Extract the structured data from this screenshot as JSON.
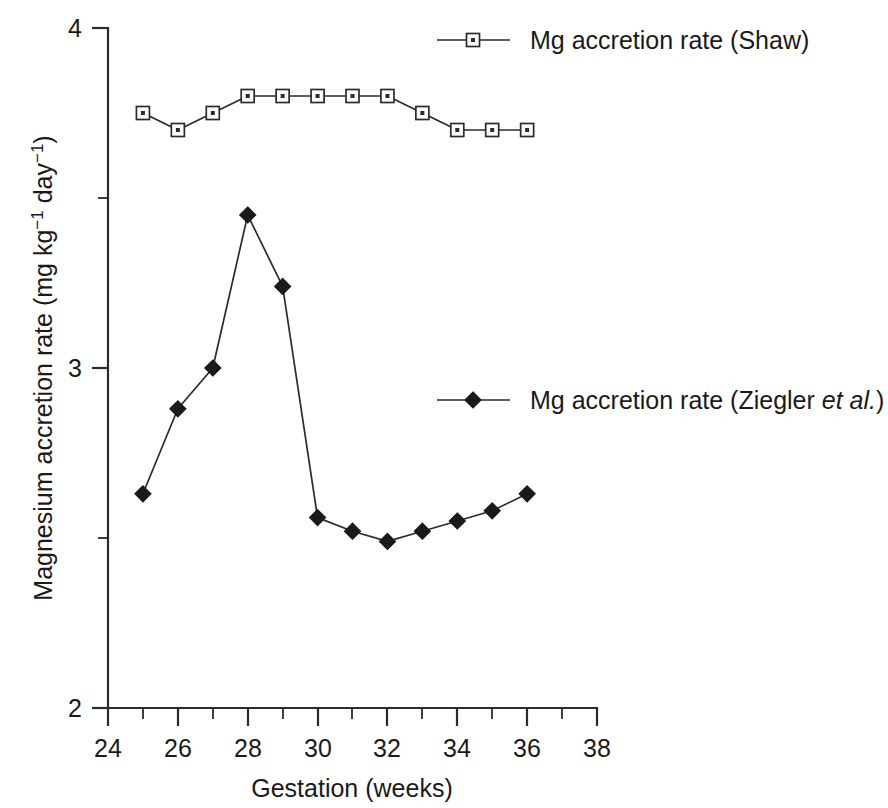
{
  "chart_data": {
    "type": "line",
    "title": "",
    "subtitle": "",
    "xlabel": "Gestation (weeks)",
    "ylabel": "Magnesium accretion rate (mg kg⁻¹ day⁻¹)",
    "ylabel_parts": {
      "lead": "Magnesium accretion rate (mg kg",
      "sup1": "−1",
      "mid": " day",
      "sup2": "−1",
      "tail": ")"
    },
    "xlim": [
      24,
      38
    ],
    "ylim": [
      2,
      4
    ],
    "grid": false,
    "legend_position": "inside-right",
    "x": [
      25,
      26,
      27,
      28,
      29,
      30,
      31,
      32,
      33,
      34,
      35,
      36
    ],
    "xtick_labels": [
      "24",
      "26",
      "28",
      "30",
      "32",
      "34",
      "36",
      "38"
    ],
    "xtick_values": [
      24,
      26,
      28,
      30,
      32,
      34,
      36,
      38
    ],
    "xtick_minor_values": [
      25,
      27,
      29,
      31,
      33,
      35,
      37
    ],
    "ytick_labels": [
      "2",
      "3",
      "4"
    ],
    "ytick_values": [
      2,
      3,
      4
    ],
    "ytick_minor_values": [
      2.5,
      3.5
    ],
    "series": [
      {
        "name": "Mg accretion rate (Shaw)",
        "marker": "open-square",
        "values": [
          3.75,
          3.7,
          3.75,
          3.8,
          3.8,
          3.8,
          3.8,
          3.8,
          3.75,
          3.7,
          3.7,
          3.7
        ]
      },
      {
        "name": "Mg accretion rate (Ziegler et al.)",
        "marker": "filled-diamond",
        "values": [
          2.63,
          2.88,
          3.0,
          3.45,
          3.24,
          2.56,
          2.52,
          2.49,
          2.52,
          2.55,
          2.58,
          2.63
        ]
      }
    ],
    "legend": [
      {
        "label": "Mg accretion rate (Shaw)",
        "label_plain": "Mg accretion rate (Shaw)",
        "label_italic": "",
        "label_tail": "",
        "marker": "open-square"
      },
      {
        "label": "Mg accretion rate (Ziegler et al.)",
        "label_plain": "Mg accretion rate (Ziegler ",
        "label_italic": "et al.",
        "label_tail": ")",
        "marker": "filled-diamond"
      }
    ],
    "colors": {
      "line": "#2b2b2b",
      "marker_fill": "#1a1a1a",
      "marker_open_fill": "#ffffff",
      "background": "#ffffff",
      "text": "#1a1a1a"
    }
  }
}
